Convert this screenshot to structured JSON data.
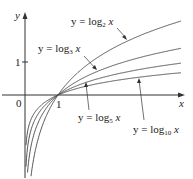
{
  "chart_data": {
    "type": "line",
    "title": "",
    "xlabel": "x",
    "ylabel": "y",
    "xlim": [
      -0.75,
      4.8
    ],
    "ylim": [
      -2.5,
      2.9
    ],
    "grid": false,
    "legend": "inline annotations with arrows",
    "x_ticks": [
      {
        "value": 0,
        "label": "0"
      },
      {
        "value": 1,
        "label": "1"
      }
    ],
    "y_ticks": [
      {
        "value": 1,
        "label": "1"
      }
    ],
    "series": [
      {
        "name": "y = log2 x",
        "base": 2,
        "x": [
          0.25,
          0.5,
          1,
          2,
          3,
          4,
          4.7
        ],
        "values": [
          -2.0,
          -1.0,
          0,
          1.0,
          1.58,
          2.0,
          2.23
        ]
      },
      {
        "name": "y = log3 x",
        "base": 3,
        "x": [
          0.2,
          0.5,
          1,
          2,
          3,
          4,
          4.7
        ],
        "values": [
          -1.46,
          -0.63,
          0,
          0.63,
          1.0,
          1.26,
          1.41
        ]
      },
      {
        "name": "y = log5 x",
        "base": 5,
        "x": [
          0.1,
          0.5,
          1,
          2,
          3,
          4,
          4.7
        ],
        "values": [
          -1.43,
          -0.43,
          0,
          0.43,
          0.68,
          0.86,
          0.96
        ]
      },
      {
        "name": "y = log10 x",
        "base": 10,
        "x": [
          0.02,
          0.5,
          1,
          2,
          3,
          4,
          4.7
        ],
        "values": [
          -1.7,
          -0.3,
          0,
          0.3,
          0.48,
          0.6,
          0.67
        ]
      }
    ],
    "annotations": [
      {
        "text": "y = log2 x",
        "series": "log2"
      },
      {
        "text": "y = log3 x",
        "series": "log3"
      },
      {
        "text": "y = log5 x",
        "series": "log5"
      },
      {
        "text": "y = log10 x",
        "series": "log10"
      }
    ]
  },
  "labels": {
    "y_axis": "y",
    "x_axis": "x",
    "origin": "0",
    "x_tick_1": "1",
    "y_tick_1": "1",
    "log2": {
      "pre": "y = log",
      "sub": "2",
      "post": "x"
    },
    "log3": {
      "pre": "y = log",
      "sub": "3",
      "post": "x"
    },
    "log5": {
      "pre": "y = log",
      "sub": "5",
      "post": "x"
    },
    "log10": {
      "pre": "y = log",
      "sub": "10",
      "post": "x"
    }
  },
  "colors": {
    "curve": "#444444",
    "axis": "#333333"
  }
}
